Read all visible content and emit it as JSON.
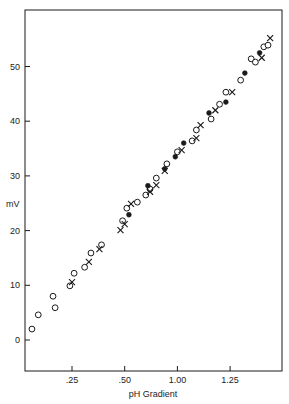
{
  "chart_data": {
    "type": "scatter",
    "title": "",
    "xlabel": "pH Gradient",
    "ylabel": "mV",
    "x_ticks": [
      {
        "label": ".25",
        "pos": 0.25
      },
      {
        "label": ".50",
        "pos": 0.5
      },
      {
        "label": "1.00",
        "pos": 0.75
      },
      {
        "label": "1.25",
        "pos": 1.0
      }
    ],
    "y_ticks": [
      0,
      10,
      20,
      30,
      40,
      50
    ],
    "xlim": [
      0.03,
      1.24
    ],
    "ylim": [
      -6,
      60
    ],
    "grid": false,
    "legend": null,
    "series": [
      {
        "name": "open circles",
        "marker": "circle-open",
        "points": [
          [
            0.06,
            2.0
          ],
          [
            0.09,
            4.6
          ],
          [
            0.16,
            8.0
          ],
          [
            0.17,
            5.9
          ],
          [
            0.24,
            9.9
          ],
          [
            0.26,
            12.2
          ],
          [
            0.31,
            13.3
          ],
          [
            0.34,
            15.9
          ],
          [
            0.39,
            17.4
          ],
          [
            0.49,
            21.8
          ],
          [
            0.51,
            24.1
          ],
          [
            0.56,
            25.2
          ],
          [
            0.6,
            26.5
          ],
          [
            0.62,
            27.6
          ],
          [
            0.65,
            29.6
          ],
          [
            0.7,
            32.2
          ],
          [
            0.75,
            34.4
          ],
          [
            0.82,
            36.4
          ],
          [
            0.84,
            38.4
          ],
          [
            0.91,
            40.4
          ],
          [
            0.95,
            43.1
          ],
          [
            0.98,
            45.3
          ],
          [
            1.05,
            47.5
          ],
          [
            1.1,
            51.4
          ],
          [
            1.12,
            50.8
          ],
          [
            1.16,
            53.6
          ],
          [
            1.18,
            53.9
          ]
        ]
      },
      {
        "name": "crosses",
        "marker": "x",
        "points": [
          [
            0.25,
            10.6
          ],
          [
            0.33,
            14.3
          ],
          [
            0.38,
            16.6
          ],
          [
            0.48,
            20.1
          ],
          [
            0.5,
            21.2
          ],
          [
            0.53,
            24.9
          ],
          [
            0.62,
            27.1
          ],
          [
            0.65,
            28.3
          ],
          [
            0.69,
            30.9
          ],
          [
            0.77,
            34.7
          ],
          [
            0.84,
            36.9
          ],
          [
            0.86,
            39.3
          ],
          [
            0.93,
            42.0
          ],
          [
            1.01,
            45.3
          ],
          [
            1.15,
            51.6
          ],
          [
            1.19,
            55.2
          ]
        ]
      },
      {
        "name": "filled circles",
        "marker": "circle-filled",
        "points": [
          [
            0.52,
            22.9
          ],
          [
            0.61,
            28.2
          ],
          [
            0.69,
            31.3
          ],
          [
            0.74,
            33.5
          ],
          [
            0.78,
            36.0
          ],
          [
            0.9,
            41.5
          ],
          [
            0.98,
            43.5
          ],
          [
            1.07,
            48.8
          ],
          [
            1.14,
            52.5
          ]
        ]
      }
    ]
  },
  "colors": {
    "ink": "#1a1a1a",
    "background": "#ffffff"
  }
}
